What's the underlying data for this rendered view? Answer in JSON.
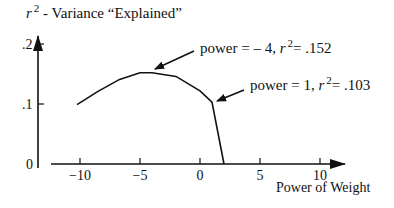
{
  "chart_data": {
    "type": "line",
    "title": "",
    "ylabel": "r² - Variance “Explained”",
    "ylabel_parts": {
      "r": "r",
      "sup": "2",
      "rest": " - Variance “Explained”"
    },
    "xlabel": "Power of Weight",
    "xlim": [
      -13,
      10.5
    ],
    "ylim": [
      0,
      0.2
    ],
    "x_ticks": [
      -10,
      -5,
      0,
      5,
      10
    ],
    "x_tick_labels": [
      "−10",
      "−5",
      "0",
      "5",
      "10"
    ],
    "y_ticks": [
      0,
      0.1,
      0.2
    ],
    "y_tick_labels": [
      "0",
      ".1",
      ".2"
    ],
    "grid": false,
    "series": [
      {
        "name": "r² vs power",
        "x": [
          -10.25,
          -8.5,
          -6.7,
          -5,
          -4,
          -2,
          0,
          1,
          2
        ],
        "y": [
          0.099,
          0.121,
          0.141,
          0.152,
          0.152,
          0.146,
          0.122,
          0.103,
          0.0
        ]
      }
    ],
    "annotations": [
      {
        "text_pre": "power = – 4, ",
        "r": "r",
        "sup": "2",
        "text_post": "= .152",
        "point": [
          -4,
          0.152
        ]
      },
      {
        "text_pre": "power = 1, ",
        "r": "r",
        "sup": "2",
        "text_post": "= .103",
        "point": [
          1,
          0.103
        ]
      }
    ]
  }
}
